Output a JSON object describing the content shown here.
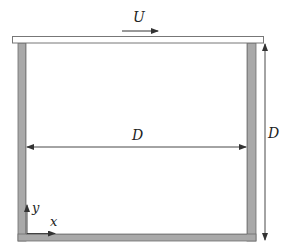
{
  "diagram": {
    "type": "lid-driven cavity schematic",
    "labels": {
      "lid_velocity": "U",
      "width": "D",
      "height": "D",
      "x_axis": "x",
      "y_axis": "y"
    },
    "colors": {
      "wall_fill": "#a9a9a9",
      "wall_stroke": "#6e6e6e",
      "lid_fill": "#ffffff",
      "lid_stroke": "#777777",
      "line": "#333333",
      "background": "#ffffff"
    },
    "geometry": {
      "lid": {
        "x": 12,
        "y": 36,
        "w": 252,
        "h": 7
      },
      "left_wall": {
        "x": 18,
        "y": 43,
        "w": 8,
        "h": 198
      },
      "right_wall": {
        "x": 247,
        "y": 43,
        "w": 9,
        "h": 198
      },
      "bottom_wall": {
        "x": 18,
        "y": 234,
        "w": 238,
        "h": 7
      },
      "width_dimension_y": 147,
      "height_dimension_x": 265
    }
  }
}
